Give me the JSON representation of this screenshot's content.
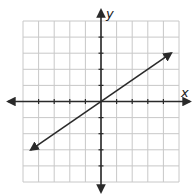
{
  "chart_data": {
    "type": "line",
    "title": "",
    "xlabel": "x",
    "ylabel": "y",
    "xlim": [
      -5,
      5
    ],
    "ylim": [
      -5,
      5
    ],
    "grid": true,
    "tick_labels": false,
    "series": [
      {
        "name": "line through origin",
        "equation": "y = (2/3)x",
        "x": [
          -4.5,
          -3,
          0,
          3,
          4.5
        ],
        "y": [
          -3,
          -2,
          0,
          2,
          3
        ],
        "arrows": "both"
      }
    ]
  },
  "axes": {
    "x_label": "x",
    "y_label": "y"
  },
  "colors": {
    "grid": "#c8c8c8",
    "axis": "#2a2a2a",
    "line": "#2a2a2a",
    "background": "#ffffff"
  }
}
